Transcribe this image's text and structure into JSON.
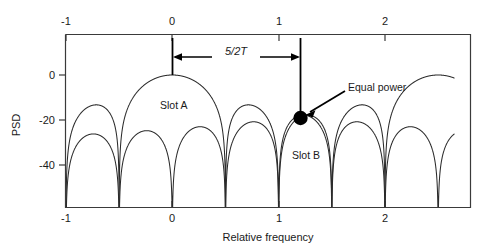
{
  "figure": {
    "background_color": "#ffffff",
    "line_color": "#2b2b2b",
    "annotation_color": "#000000"
  },
  "axes": {
    "xlabel": "Relative frequency",
    "ylabel": "PSD",
    "x_ticks_bottom": [
      "-1",
      "0",
      "1",
      "2"
    ],
    "x_ticks_top": [
      "-1",
      "0",
      "1",
      "2"
    ],
    "y_ticks": [
      "0",
      "-20",
      "-40"
    ]
  },
  "annotations": {
    "span_label": "5/2T",
    "slot_a_label": "Slot A",
    "slot_b_label": "Slot B",
    "equal_power_label": "Equal power"
  },
  "chart_data": {
    "type": "line",
    "title": "",
    "xlabel": "Relative frequency",
    "ylabel": "PSD",
    "xlim": [
      -1.18,
      2.65
    ],
    "ylim": [
      -62,
      12
    ],
    "grid": false,
    "legend": false,
    "x_ticks": [
      -1,
      0,
      1,
      2
    ],
    "y_ticks": [
      0,
      -20,
      -40
    ],
    "y_unit": "dB",
    "series": [
      {
        "name": "Slot A",
        "description": "Sinc-squared PSD centered at relative frequency 0, main lobe peak 0 dB, first nulls at -0.5 and +0.5, sidelobe peaks near -13 dB then decaying",
        "center": 0.0,
        "null_spacing": 0.5,
        "peak_db": 0,
        "sidelobe_peaks_db": [
          -13.3,
          -17.8,
          -20.8,
          -23.0,
          -24.7,
          -26.2
        ],
        "label_position": [
          0.12,
          -10
        ]
      },
      {
        "name": "Slot B",
        "description": "Second sinc-squared PSD shifted to higher frequency; its lobes cross Slot A lobes at the equal power point",
        "center": 2.5,
        "null_spacing": 0.5,
        "peak_db": 0,
        "sidelobe_peaks_db": [
          -13.3,
          -17.8,
          -20.8,
          -23.0,
          -24.7,
          -26.2
        ],
        "label_position": [
          1.22,
          -33
        ]
      }
    ],
    "markers": [
      {
        "name": "equal-power-point",
        "label": "Equal power",
        "x": 1.2,
        "y": -18,
        "style": "filled-circle"
      }
    ],
    "span_annotations": [
      {
        "name": "slot-separation",
        "label": "5/2T",
        "from_x": 0.0,
        "to_x": 1.2,
        "y_db": 6.5
      }
    ]
  }
}
